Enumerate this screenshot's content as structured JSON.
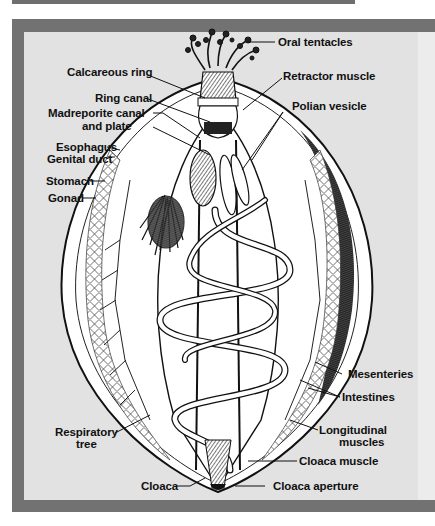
{
  "figure": {
    "colors": {
      "frame": "#727272",
      "panel": "#e2e2e2",
      "ink": "#111111",
      "body": "#ffffff"
    },
    "labels_left": [
      {
        "id": "calcareous-ring",
        "text": "Calcareous ring"
      },
      {
        "id": "ring-canal",
        "text": "Ring canal"
      },
      {
        "id": "madreporite-canal",
        "text": "Madreporite canal"
      },
      {
        "id": "madreporite-plate",
        "text": "and plate"
      },
      {
        "id": "esophagus",
        "text": "Esophagus"
      },
      {
        "id": "genital-duct",
        "text": "Genital duct"
      },
      {
        "id": "stomach",
        "text": "Stomach"
      },
      {
        "id": "gonad",
        "text": "Gonad"
      },
      {
        "id": "respiratory-tree-1",
        "text": "Respiratory"
      },
      {
        "id": "respiratory-tree-2",
        "text": "tree"
      },
      {
        "id": "cloaca",
        "text": "Cloaca"
      }
    ],
    "labels_right": [
      {
        "id": "oral-tentacles",
        "text": "Oral tentacles"
      },
      {
        "id": "retractor-muscle",
        "text": "Retractor muscle"
      },
      {
        "id": "polian-vesicle",
        "text": "Polian vesicle"
      },
      {
        "id": "mesenteries",
        "text": "Mesenteries"
      },
      {
        "id": "intestines",
        "text": "Intestines"
      },
      {
        "id": "longitudinal-muscles-1",
        "text": "Longitudinal"
      },
      {
        "id": "longitudinal-muscles-2",
        "text": "muscles"
      },
      {
        "id": "cloaca-muscle",
        "text": "Cloaca muscle"
      },
      {
        "id": "cloaca-aperture",
        "text": "Cloaca aperture"
      }
    ]
  }
}
